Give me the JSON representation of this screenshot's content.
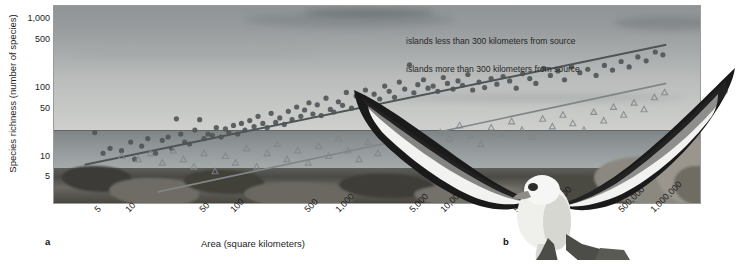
{
  "figure": {
    "panels": [
      {
        "letter": "a",
        "kind": "scatter-plot"
      },
      {
        "letter": "b",
        "kind": "photograph-albatross"
      }
    ]
  },
  "chart_data": {
    "type": "scatter",
    "title": "",
    "xlabel": "Area (square kilometers)",
    "ylabel": "Species richness (number of species)",
    "xscale": "log",
    "yscale": "log",
    "xticks": [
      "5",
      "10",
      "50",
      "100",
      "500",
      "1,000",
      "5,000",
      "10,000",
      "50,000",
      "100,000",
      "500,000",
      "1,000,000"
    ],
    "xtick_values": [
      5,
      10,
      50,
      100,
      500,
      1000,
      5000,
      10000,
      50000,
      100000,
      500000,
      1000000
    ],
    "yticks": [
      "1,000",
      "500",
      "100",
      "50",
      "10",
      "5"
    ],
    "ytick_values": [
      1000,
      500,
      100,
      50,
      10,
      5
    ],
    "xlim": [
      2,
      3000000
    ],
    "ylim": [
      2,
      1600
    ],
    "grid": false,
    "legend_position": "upper-right-inside",
    "series": [
      {
        "name": "islands less than 300 kilometers from source",
        "marker": "circle",
        "color": "#4f5456",
        "fit_line": {
          "x": [
            4,
            1400000
          ],
          "y": [
            7.5,
            420
          ]
        },
        "points": [
          [
            5,
            22
          ],
          [
            6,
            11
          ],
          [
            7,
            13
          ],
          [
            9,
            12
          ],
          [
            11,
            16
          ],
          [
            12,
            9
          ],
          [
            14,
            14
          ],
          [
            16,
            18
          ],
          [
            19,
            11
          ],
          [
            22,
            17
          ],
          [
            25,
            19
          ],
          [
            27,
            13
          ],
          [
            30,
            35
          ],
          [
            33,
            21
          ],
          [
            36,
            16
          ],
          [
            40,
            15
          ],
          [
            45,
            24
          ],
          [
            50,
            34
          ],
          [
            55,
            18
          ],
          [
            60,
            21
          ],
          [
            66,
            20
          ],
          [
            72,
            26
          ],
          [
            80,
            19
          ],
          [
            88,
            25
          ],
          [
            95,
            22
          ],
          [
            105,
            28
          ],
          [
            115,
            21
          ],
          [
            125,
            30
          ],
          [
            135,
            24
          ],
          [
            150,
            33
          ],
          [
            165,
            27
          ],
          [
            180,
            38
          ],
          [
            200,
            30
          ],
          [
            220,
            26
          ],
          [
            240,
            42
          ],
          [
            265,
            31
          ],
          [
            290,
            36
          ],
          [
            320,
            29
          ],
          [
            350,
            45
          ],
          [
            380,
            34
          ],
          [
            420,
            52
          ],
          [
            460,
            38
          ],
          [
            500,
            47
          ],
          [
            550,
            60
          ],
          [
            600,
            41
          ],
          [
            660,
            56
          ],
          [
            720,
            39
          ],
          [
            800,
            70
          ],
          [
            880,
            48
          ],
          [
            950,
            44
          ],
          [
            1050,
            62
          ],
          [
            1150,
            55
          ],
          [
            1250,
            85
          ],
          [
            1400,
            50
          ],
          [
            1550,
            75
          ],
          [
            1700,
            64
          ],
          [
            1900,
            92
          ],
          [
            2100,
            58
          ],
          [
            2300,
            80
          ],
          [
            2600,
            68
          ],
          [
            2900,
            105
          ],
          [
            3200,
            88
          ],
          [
            3600,
            72
          ],
          [
            4000,
            120
          ],
          [
            4500,
            95
          ],
          [
            5000,
            215
          ],
          [
            5500,
            84
          ],
          [
            6000,
            110
          ],
          [
            6800,
            130
          ],
          [
            7500,
            98
          ],
          [
            8400,
            105
          ],
          [
            9300,
            88
          ],
          [
            10500,
            140
          ],
          [
            11500,
            115
          ],
          [
            13000,
            95
          ],
          [
            14500,
            125
          ],
          [
            16000,
            108
          ],
          [
            18000,
            155
          ],
          [
            20000,
            92
          ],
          [
            23000,
            120
          ],
          [
            26000,
            100
          ],
          [
            30000,
            135
          ],
          [
            34000,
            112
          ],
          [
            39000,
            145
          ],
          [
            45000,
            125
          ],
          [
            52000,
            98
          ],
          [
            60000,
            160
          ],
          [
            70000,
            135
          ],
          [
            80000,
            115
          ],
          [
            95000,
            190
          ],
          [
            110000,
            150
          ],
          [
            130000,
            175
          ],
          [
            150000,
            130
          ],
          [
            175000,
            200
          ],
          [
            210000,
            165
          ],
          [
            250000,
            185
          ],
          [
            300000,
            150
          ],
          [
            360000,
            210
          ],
          [
            430000,
            180
          ],
          [
            520000,
            240
          ],
          [
            620000,
            200
          ],
          [
            750000,
            280
          ],
          [
            900000,
            245
          ],
          [
            1100000,
            330
          ],
          [
            1300000,
            300
          ]
        ]
      },
      {
        "name": "islands more than 300 kilometers from source",
        "marker": "triangle",
        "color": "#7f8688",
        "fit_line": {
          "x": [
            20,
            1400000
          ],
          "y": [
            3.0,
            115
          ]
        },
        "points": [
          [
            9,
            10
          ],
          [
            13,
            9
          ],
          [
            17,
            11
          ],
          [
            22,
            8
          ],
          [
            28,
            12
          ],
          [
            35,
            9
          ],
          [
            44,
            7
          ],
          [
            55,
            11
          ],
          [
            70,
            6
          ],
          [
            88,
            10
          ],
          [
            110,
            8
          ],
          [
            140,
            13
          ],
          [
            175,
            7
          ],
          [
            220,
            11
          ],
          [
            275,
            15
          ],
          [
            340,
            9
          ],
          [
            430,
            12
          ],
          [
            540,
            8
          ],
          [
            680,
            14
          ],
          [
            850,
            10
          ],
          [
            1050,
            18
          ],
          [
            1300,
            12
          ],
          [
            1650,
            9
          ],
          [
            2000,
            16
          ],
          [
            2500,
            11
          ],
          [
            3200,
            20
          ],
          [
            4000,
            14
          ],
          [
            5000,
            24
          ],
          [
            6200,
            16
          ],
          [
            7800,
            13
          ],
          [
            9800,
            22
          ],
          [
            12000,
            18
          ],
          [
            15000,
            28
          ],
          [
            19000,
            20
          ],
          [
            24000,
            15
          ],
          [
            30000,
            26
          ],
          [
            38000,
            21
          ],
          [
            47000,
            32
          ],
          [
            59000,
            24
          ],
          [
            74000,
            19
          ],
          [
            93000,
            35
          ],
          [
            115000,
            27
          ],
          [
            145000,
            40
          ],
          [
            180000,
            30
          ],
          [
            230000,
            24
          ],
          [
            285000,
            44
          ],
          [
            355000,
            33
          ],
          [
            440000,
            52
          ],
          [
            550000,
            40
          ],
          [
            690000,
            60
          ],
          [
            860000,
            48
          ],
          [
            1080000,
            72
          ],
          [
            1350000,
            85
          ]
        ]
      }
    ],
    "annotations": [
      {
        "text": "islands less than 300 kilometers from source",
        "series": 0
      },
      {
        "text": "islands more than 300 kilometers from source",
        "series": 1
      }
    ]
  },
  "panel_a": {
    "letter": "a",
    "xlabel": "Area (square kilometers)",
    "ylabel": "Species richness (number of species)",
    "xticks": [
      "5",
      "10",
      "50",
      "100",
      "500",
      "1,000",
      "5,000",
      "10,000",
      "50,000",
      "100,000",
      "500,000",
      "1,000,000"
    ],
    "yticks": [
      "1,000",
      "500",
      "100",
      "50",
      "10",
      "5"
    ],
    "legend": [
      "islands less than 300 kilometers from source",
      "islands more than 300 kilometers from source"
    ]
  },
  "panel_b": {
    "letter": "b",
    "subject": "albatross-in-flight"
  },
  "colors": {
    "series_near": "#4f5456",
    "series_far": "#7f8688",
    "text": "#1d1d1d",
    "frame": "#9a9a9a",
    "background": "#ffffff"
  }
}
